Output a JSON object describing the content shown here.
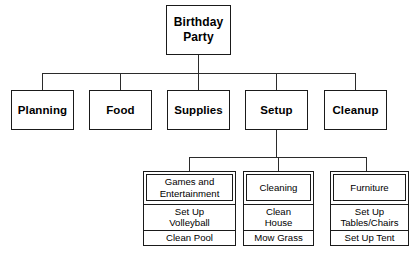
{
  "diagram": {
    "type": "work-breakdown-structure",
    "root": {
      "label": "Birthday\nParty"
    },
    "level2": [
      {
        "label": "Planning"
      },
      {
        "label": "Food"
      },
      {
        "label": "Supplies"
      },
      {
        "label": "Setup"
      },
      {
        "label": "Cleanup"
      }
    ],
    "level3": [
      {
        "header": "Games and\nEntertainment",
        "items": [
          "Set Up\nVolleyball",
          "Clean Pool"
        ]
      },
      {
        "header": "Cleaning",
        "items": [
          "Clean\nHouse",
          "Mow Grass"
        ]
      },
      {
        "header": "Furniture",
        "items": [
          "Set Up\nTables/Chairs",
          "Set Up Tent"
        ]
      }
    ]
  },
  "colors": {
    "line": "#1a1a1a",
    "background": "#ffffff",
    "text": "#000000"
  }
}
